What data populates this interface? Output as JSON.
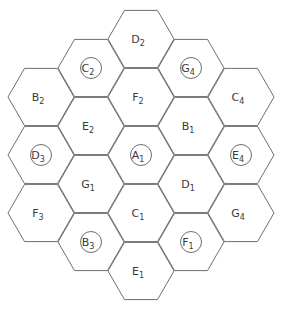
{
  "diagram": {
    "type": "hexagonal-cell-grid",
    "orientation": "flat-top",
    "hex_radius": 33,
    "cells": [
      {
        "id": "B2",
        "letter": "B",
        "sub": "2",
        "cx": 41,
        "cy": 97,
        "circled": false
      },
      {
        "id": "D3",
        "letter": "D",
        "sub": "3",
        "cx": 41,
        "cy": 155,
        "circled": true
      },
      {
        "id": "F3",
        "letter": "F",
        "sub": "3",
        "cx": 41,
        "cy": 213,
        "circled": false
      },
      {
        "id": "C2",
        "letter": "C",
        "sub": "2",
        "cx": 91,
        "cy": 68,
        "circled": true
      },
      {
        "id": "E2",
        "letter": "E",
        "sub": "2",
        "cx": 91,
        "cy": 126,
        "circled": false
      },
      {
        "id": "G1",
        "letter": "G",
        "sub": "1",
        "cx": 91,
        "cy": 184,
        "circled": false
      },
      {
        "id": "B3",
        "letter": "B",
        "sub": "3",
        "cx": 91,
        "cy": 242,
        "circled": true
      },
      {
        "id": "D2",
        "letter": "D",
        "sub": "2",
        "cx": 141,
        "cy": 39,
        "circled": false
      },
      {
        "id": "F2",
        "letter": "F",
        "sub": "2",
        "cx": 141,
        "cy": 97,
        "circled": false
      },
      {
        "id": "A1",
        "letter": "A",
        "sub": "1",
        "cx": 141,
        "cy": 155,
        "circled": true
      },
      {
        "id": "C1",
        "letter": "C",
        "sub": "1",
        "cx": 141,
        "cy": 213,
        "circled": false
      },
      {
        "id": "E1",
        "letter": "E",
        "sub": "1",
        "cx": 141,
        "cy": 271,
        "circled": false
      },
      {
        "id": "G4a",
        "letter": "G",
        "sub": "4",
        "cx": 191,
        "cy": 68,
        "circled": true
      },
      {
        "id": "B1",
        "letter": "B",
        "sub": "1",
        "cx": 191,
        "cy": 126,
        "circled": false
      },
      {
        "id": "D1",
        "letter": "D",
        "sub": "1",
        "cx": 191,
        "cy": 184,
        "circled": false
      },
      {
        "id": "F1",
        "letter": "F",
        "sub": "1",
        "cx": 191,
        "cy": 242,
        "circled": true
      },
      {
        "id": "C4",
        "letter": "C",
        "sub": "4",
        "cx": 241,
        "cy": 97,
        "circled": false
      },
      {
        "id": "E4",
        "letter": "E",
        "sub": "4",
        "cx": 241,
        "cy": 155,
        "circled": true
      },
      {
        "id": "G4b",
        "letter": "G",
        "sub": "4",
        "cx": 241,
        "cy": 213,
        "circled": false
      }
    ]
  },
  "style": {
    "stroke": "#6e6e6e",
    "text": "#3a3a3a",
    "background": "#ffffff"
  }
}
